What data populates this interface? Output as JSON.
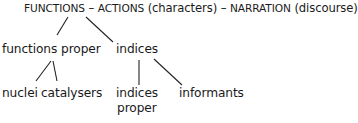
{
  "diagram": {
    "type": "tree",
    "root": {
      "parts": [
        {
          "text": "FUNCTIONS",
          "style": "caps"
        },
        {
          "text": " – ",
          "style": "normal"
        },
        {
          "text": "ACTIONS",
          "style": "caps"
        },
        {
          "text": " (characters) – ",
          "style": "normal"
        },
        {
          "text": "NARRATION",
          "style": "caps"
        },
        {
          "text": " (discourse)",
          "style": "normal"
        }
      ]
    },
    "level1": {
      "functions_proper": "functions proper",
      "indices": "indices"
    },
    "level2": {
      "nuclei": "nuclei",
      "catalysers": "catalysers",
      "indices_proper_line1": "indices",
      "indices_proper_line2": "proper",
      "informants": "informants"
    },
    "edges": [
      {
        "from": "FUNCTIONS",
        "to": "functions proper"
      },
      {
        "from": "FUNCTIONS",
        "to": "indices"
      },
      {
        "from": "functions proper",
        "to": "nuclei"
      },
      {
        "from": "functions proper",
        "to": "catalysers"
      },
      {
        "from": "indices",
        "to": "indices proper"
      },
      {
        "from": "indices",
        "to": "informants"
      }
    ]
  }
}
